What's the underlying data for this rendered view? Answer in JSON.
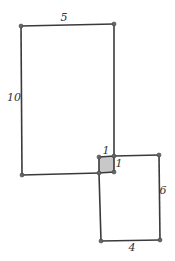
{
  "diagram": {
    "title": "",
    "colors": {
      "stroke": "#3a3a3a",
      "overlap_fill": "#c8c8c8",
      "vertex": "#666666",
      "label": "#333333"
    },
    "large_rectangle": {
      "width_label": "5",
      "height_label": "10"
    },
    "small_rectangle": {
      "width_label": "4",
      "height_label": "6"
    },
    "overlap_square": {
      "top_label": "1",
      "right_label": "1"
    }
  }
}
